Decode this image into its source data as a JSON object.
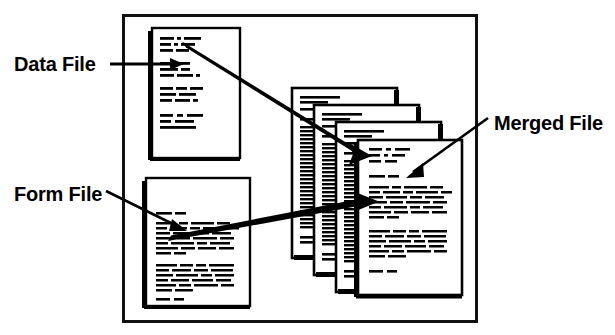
{
  "diagram": {
    "type": "mail-merge-illustration",
    "background_color": "#ffffff",
    "ink_color": "#000000",
    "frame": {
      "x": 122,
      "y": 14,
      "width": 355,
      "height": 308,
      "stroke_width": 3
    },
    "labels": [
      {
        "id": "data-file",
        "text": "Data File",
        "x": 14,
        "y": 70,
        "leader": "horizontal line with arrowhead pointing right into the data page"
      },
      {
        "id": "form-file",
        "text": "Form File",
        "x": 14,
        "y": 200,
        "leader": "diagonal line with arrowhead pointing down-right into the form page"
      },
      {
        "id": "merged-file",
        "text": "Merged File",
        "x": 494,
        "y": 130,
        "leader": "diagonal line with arrowhead pointing down-left into the merged page"
      }
    ],
    "pages": [
      {
        "id": "data-page",
        "role": "Data File",
        "x": 152,
        "y": 28,
        "width": 88,
        "height": 130,
        "content_style": "short-dashed-field-lines",
        "line_groups": [
          3,
          2,
          3,
          3
        ]
      },
      {
        "id": "form-page",
        "role": "Form File",
        "x": 146,
        "y": 178,
        "width": 104,
        "height": 128,
        "content_style": "dense-paragraph-lines",
        "paragraphs": [
          1,
          7,
          6,
          1
        ]
      },
      {
        "id": "merged-stack-back-3",
        "role": "Merged File (stack copy 4)",
        "x": 292,
        "y": 88,
        "width": 105,
        "height": 170,
        "content_style": "dense-ruled-lines"
      },
      {
        "id": "merged-stack-back-2",
        "role": "Merged File (stack copy 3)",
        "x": 314,
        "y": 105,
        "width": 105,
        "height": 170,
        "content_style": "dense-ruled-lines"
      },
      {
        "id": "merged-stack-back-1",
        "role": "Merged File (stack copy 2)",
        "x": 336,
        "y": 122,
        "width": 105,
        "height": 170,
        "content_style": "dense-ruled-lines"
      },
      {
        "id": "merged-page-front",
        "role": "Merged File (front)",
        "x": 358,
        "y": 140,
        "width": 104,
        "height": 155,
        "content_style": "letter-with-address-block",
        "paragraphs": [
          3,
          1,
          7,
          6,
          1
        ]
      }
    ],
    "arrows": [
      {
        "id": "data-to-merged-arrow",
        "from": "data-page",
        "to": "merged-page-front",
        "x1": 183,
        "y1": 44,
        "x2": 368,
        "y2": 155,
        "style": "thick-tapered-diagonal"
      },
      {
        "id": "form-to-merged-arrow",
        "from": "form-page",
        "to": "merged-page-front",
        "x1": 170,
        "y1": 239,
        "x2": 376,
        "y2": 202,
        "style": "thick-tapered-diagonal"
      }
    ]
  }
}
